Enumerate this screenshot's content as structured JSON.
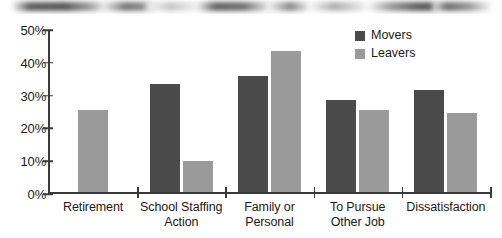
{
  "scan_artifact": {
    "name": "blurred-scan-strip",
    "visible": true
  },
  "legend": {
    "position": "top-right",
    "entries": [
      {
        "label": "Movers",
        "color": "#4a4a4a"
      },
      {
        "label": "Leavers",
        "color": "#9a9a9a"
      }
    ]
  },
  "chart_data": {
    "type": "bar",
    "title": "",
    "subtitle": "",
    "xlabel": "",
    "ylabel": "",
    "ylim": [
      0,
      50
    ],
    "ytick_labels": [
      "50%",
      "40%",
      "30%",
      "20%",
      "10%",
      "0%"
    ],
    "ytick_values": [
      50,
      40,
      30,
      20,
      10,
      0
    ],
    "grid": false,
    "legend_position": "top-right",
    "categories": [
      "Retirement",
      "School Staffing Action",
      "Family or Personal",
      "To Pursue Other Job",
      "Dissatisfaction"
    ],
    "category_lines": [
      [
        "Retirement"
      ],
      [
        "School Staffing",
        "Action"
      ],
      [
        "Family or",
        "Personal"
      ],
      [
        "To Pursue",
        "Other Job"
      ],
      [
        "Dissatisfaction"
      ]
    ],
    "series": [
      {
        "name": "Movers",
        "color": "#4a4a4a",
        "values": [
          null,
          33,
          35.5,
          28,
          31
        ]
      },
      {
        "name": "Leavers",
        "color": "#9a9a9a",
        "values": [
          25,
          9.5,
          43,
          25,
          24
        ]
      }
    ]
  }
}
